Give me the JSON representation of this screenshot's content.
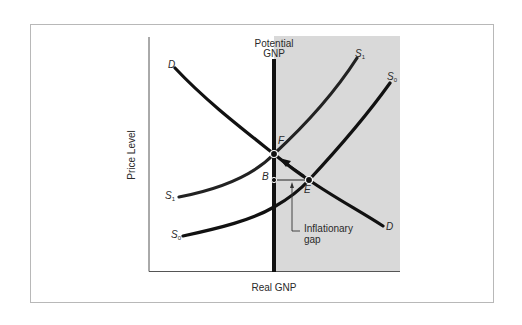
{
  "diagram": {
    "type": "aggregate supply-demand diagram",
    "x_axis_label": "Real GNP",
    "y_axis_label": "Price Level",
    "vertical_line_label_line1": "Potential",
    "vertical_line_label_line2": "GNP",
    "shaded_region": "area to the right of Potential GNP",
    "curves": {
      "demand": {
        "label": "D",
        "label_end": "D"
      },
      "supply_initial": {
        "label": "S",
        "subscript": "0"
      },
      "supply_shifted": {
        "label": "S",
        "subscript": "1"
      }
    },
    "points": {
      "F": "F",
      "E": "E",
      "B": "B"
    },
    "annotation_line1": "Inflationary",
    "annotation_line2": "gap",
    "colors": {
      "curve": "#111111",
      "shade": "#d9d9d9",
      "frame": "#b8b8b8",
      "axis": "#555555"
    }
  }
}
